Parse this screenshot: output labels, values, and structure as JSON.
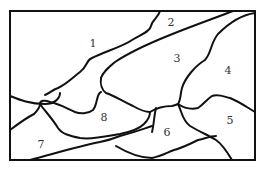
{
  "diagram": {
    "type": "region-map",
    "regions": [
      {
        "id": "1",
        "label": "1",
        "x": 93,
        "y": 47
      },
      {
        "id": "2",
        "label": "2",
        "x": 171,
        "y": 26
      },
      {
        "id": "3",
        "label": "3",
        "x": 177,
        "y": 62
      },
      {
        "id": "4",
        "label": "4",
        "x": 228,
        "y": 74
      },
      {
        "id": "5",
        "label": "5",
        "x": 230,
        "y": 124
      },
      {
        "id": "6",
        "label": "6",
        "x": 167,
        "y": 136
      },
      {
        "id": "7",
        "label": "7",
        "x": 41,
        "y": 148
      },
      {
        "id": "8",
        "label": "8",
        "x": 104,
        "y": 121
      }
    ],
    "stroke_color": "#111111",
    "label_color": "#333333"
  }
}
